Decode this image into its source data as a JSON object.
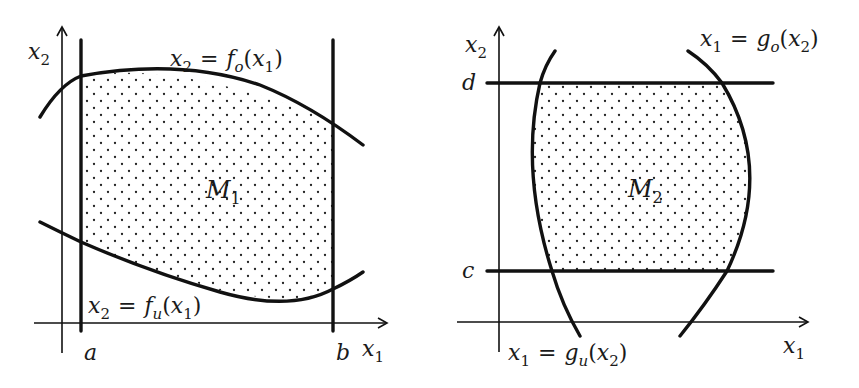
{
  "figures": [
    {
      "id": "left",
      "region_label": "M",
      "region_sub": "1",
      "axis_x_label": "x",
      "axis_x_sub": "1",
      "axis_y_label": "x",
      "axis_y_sub": "2",
      "vertical_bound_left": "a",
      "vertical_bound_right": "b",
      "upper_curve_label": {
        "lhs": "x",
        "lhs_sub": "2",
        "eq": "=",
        "fn": "f",
        "fn_sub": "o",
        "arg": "x",
        "arg_sub": "1"
      },
      "lower_curve_label": {
        "lhs": "x",
        "lhs_sub": "2",
        "eq": "=",
        "fn": "f",
        "fn_sub": "u",
        "arg": "x",
        "arg_sub": "1"
      }
    },
    {
      "id": "right",
      "region_label": "M",
      "region_sub": "2",
      "axis_x_label": "x",
      "axis_x_sub": "1",
      "axis_y_label": "x",
      "axis_y_sub": "2",
      "horizontal_bound_top": "d",
      "horizontal_bound_bottom": "c",
      "right_curve_label": {
        "lhs": "x",
        "lhs_sub": "1",
        "eq": "=",
        "fn": "g",
        "fn_sub": "o",
        "arg": "x",
        "arg_sub": "2"
      },
      "left_curve_label": {
        "lhs": "x",
        "lhs_sub": "1",
        "eq": "=",
        "fn": "g",
        "fn_sub": "u",
        "arg": "x",
        "arg_sub": "2"
      }
    }
  ],
  "colors": {
    "stroke": "#111111",
    "dots": "#222222",
    "background": "#ffffff"
  }
}
